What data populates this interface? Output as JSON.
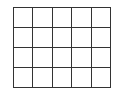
{
  "grid": {
    "rows": 4,
    "columns": 5,
    "line_color": "#333333",
    "cell_fill": "#ffffff",
    "cells": [
      [
        "",
        "",
        "",
        "",
        ""
      ],
      [
        "",
        "",
        "",
        "",
        ""
      ],
      [
        "",
        "",
        "",
        "",
        ""
      ],
      [
        "",
        "",
        "",
        "",
        ""
      ]
    ]
  }
}
